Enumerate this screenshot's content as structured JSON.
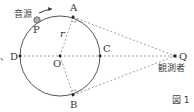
{
  "figure": {
    "caption": "図 1",
    "source_label": "音源",
    "observer_label": "観測者",
    "points": {
      "A": "A",
      "B": "B",
      "C": "C",
      "D": "D",
      "O": "O",
      "P": "P",
      "Q": "Q"
    },
    "radius_label": "r",
    "left_mark": "、"
  },
  "colors": {
    "line": "#555555",
    "dashed": "#888888",
    "source_fill": "#b0b0b0"
  }
}
